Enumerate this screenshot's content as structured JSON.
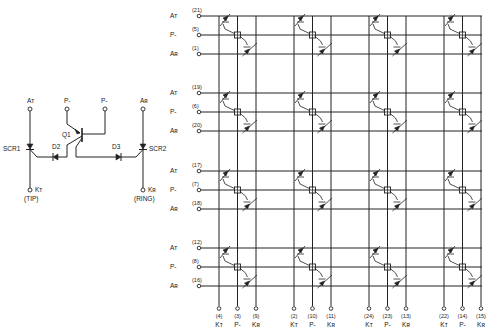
{
  "figure": {
    "line_color": "#222222",
    "background": "#ffffff"
  },
  "cell": {
    "terminals": {
      "anode_tip": "Aᴛ",
      "pminus_left": "P-",
      "pminus_right": "P-",
      "anode_ring": "Aʀ",
      "cathode_tip": "Kᴛ",
      "cathode_ring": "Kʀ"
    },
    "components": {
      "scr1": "SCR1",
      "scr2": "SCR2",
      "q1": "Q1",
      "d2": "D2",
      "d3": "D3"
    },
    "captions": {
      "tip": "(TIP)",
      "ring": "(RING)"
    }
  },
  "array": {
    "row_groups": [
      {
        "rows": [
          {
            "label": "Aᴛ",
            "pin": "(21)"
          },
          {
            "label": "P-",
            "pin": "(5)"
          },
          {
            "label": "Aʀ",
            "pin": "(1)"
          }
        ]
      },
      {
        "rows": [
          {
            "label": "Aᴛ",
            "pin": "(19)"
          },
          {
            "label": "P-",
            "pin": "(6)"
          },
          {
            "label": "Aʀ",
            "pin": "(20)"
          }
        ]
      },
      {
        "rows": [
          {
            "label": "Aᴛ",
            "pin": "(17)"
          },
          {
            "label": "P-",
            "pin": "(7)"
          },
          {
            "label": "Aʀ",
            "pin": "(18)"
          }
        ]
      },
      {
        "rows": [
          {
            "label": "Aᴛ",
            "pin": "(12)"
          },
          {
            "label": "P-",
            "pin": "(8)"
          },
          {
            "label": "Aʀ",
            "pin": "(16)"
          }
        ]
      }
    ],
    "column_groups": [
      {
        "cols": [
          {
            "label": "Kᴛ",
            "pin": "(4)"
          },
          {
            "label": "P-",
            "pin": "(3)"
          },
          {
            "label": "Kʀ",
            "pin": "(9)"
          }
        ]
      },
      {
        "cols": [
          {
            "label": "Kᴛ",
            "pin": "(2)"
          },
          {
            "label": "P-",
            "pin": "(10)"
          },
          {
            "label": "Kʀ",
            "pin": "(11)"
          }
        ]
      },
      {
        "cols": [
          {
            "label": "Kᴛ",
            "pin": "(24)"
          },
          {
            "label": "P-",
            "pin": "(23)"
          },
          {
            "label": "Kʀ",
            "pin": "(13)"
          }
        ]
      },
      {
        "cols": [
          {
            "label": "Kᴛ",
            "pin": "(22)"
          },
          {
            "label": "P-",
            "pin": "(14)"
          },
          {
            "label": "Kʀ",
            "pin": "(15)"
          }
        ]
      }
    ]
  }
}
